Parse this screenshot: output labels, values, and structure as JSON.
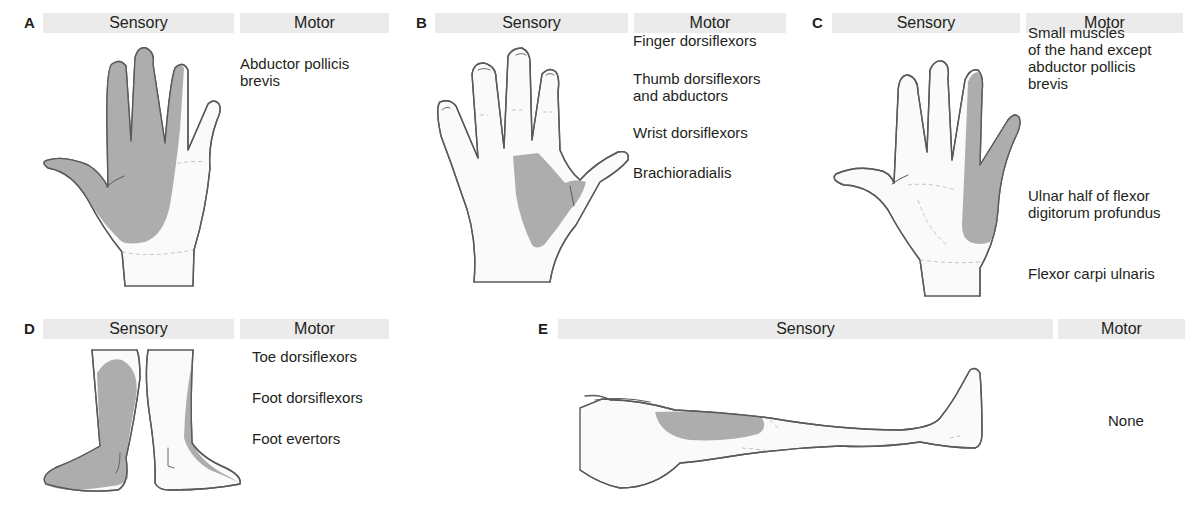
{
  "panels": [
    {
      "id": "A",
      "letter": "A",
      "sensory_label": "Sensory",
      "motor_label": "Motor",
      "region": "median nerve — palmar radial 3½ digits",
      "motor": [
        "Abductor pollicis\nbrevis"
      ]
    },
    {
      "id": "B",
      "letter": "B",
      "sensory_label": "Sensory",
      "motor_label": "Motor",
      "region": "radial nerve — dorsal first web space",
      "motor": [
        "Finger dorsiflexors",
        "Thumb dorsiflexors\nand abductors",
        "Wrist dorsiflexors",
        "Brachioradialis"
      ]
    },
    {
      "id": "C",
      "letter": "C",
      "sensory_label": "Sensory",
      "motor_label": "Motor",
      "region": "ulnar nerve — ulnar 1½ digits",
      "motor": [
        "Small muscles\nof the hand except\nabductor pollicis\nbrevis",
        "Ulnar half of flexor\ndigitorum profundus",
        "Flexor carpi ulnaris"
      ]
    },
    {
      "id": "D",
      "letter": "D",
      "sensory_label": "Sensory",
      "motor_label": "Motor",
      "region": "common peroneal nerve — lateral leg and dorsum of foot",
      "motor": [
        "Toe dorsiflexors",
        "Foot dorsiflexors",
        "Foot evertors"
      ]
    },
    {
      "id": "E",
      "letter": "E",
      "sensory_label": "Sensory",
      "motor_label": "Motor",
      "region": "lateral cutaneous nerve of thigh",
      "motor": [
        "None"
      ]
    }
  ],
  "colors": {
    "header_bg": "#ebebeb",
    "shade": "#a9a9a9",
    "outline": "#5a5a5a",
    "text": "#231f20"
  }
}
